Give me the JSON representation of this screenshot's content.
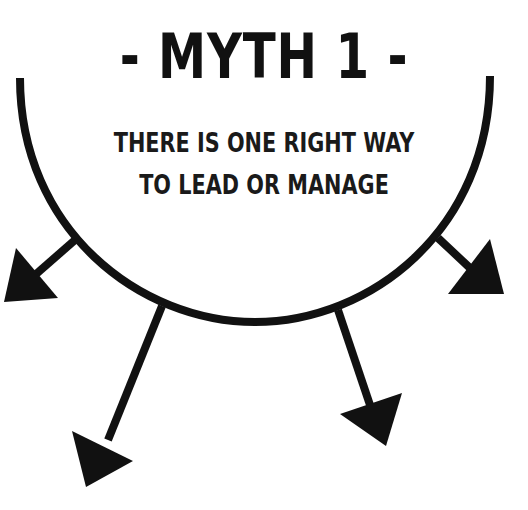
{
  "title": "- MYTH 1 -",
  "subtitle_line1": "THERE IS ONE RIGHT WAY",
  "subtitle_line2": "TO LEAD OR MANAGE",
  "colors": {
    "ink": "#111111",
    "background": "#ffffff"
  }
}
